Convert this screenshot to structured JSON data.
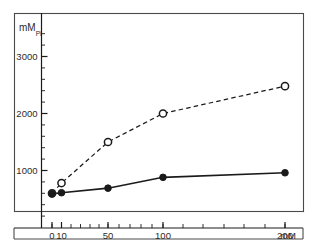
{
  "figure": {
    "background_color": "#ffffff",
    "frame_color": "#4a4a4a",
    "ink_color": "#1a1a1a",
    "y_axis_title_main": "mM",
    "y_axis_title_sub": "Pi",
    "x_axis_unit": "mM"
  },
  "chart_data": {
    "type": "line",
    "title": "",
    "xlabel": "mM",
    "ylabel": "mM Pi",
    "x": [
      0,
      10,
      50,
      100,
      200
    ],
    "x_tick_labels": [
      "0",
      "10",
      "50",
      "100",
      "200"
    ],
    "y_tick_labels": [
      "1000",
      "2000",
      "3000"
    ],
    "y_ticks": [
      1000,
      2000,
      3000
    ],
    "ylim": [
      0,
      3400
    ],
    "xlim_positions": [
      0,
      10,
      50,
      100,
      200
    ],
    "grid": false,
    "legend_position": "none",
    "series": [
      {
        "name": "open-circle-dashed",
        "marker": "open-circle",
        "linestyle": "dashed",
        "values": [
          600,
          780,
          1500,
          2000,
          2480
        ]
      },
      {
        "name": "filled-circle-solid",
        "marker": "filled-circle",
        "linestyle": "solid",
        "values": [
          590,
          610,
          690,
          880,
          960
        ]
      }
    ]
  }
}
